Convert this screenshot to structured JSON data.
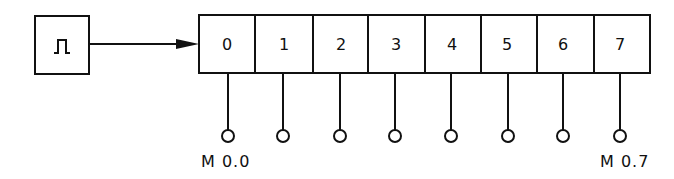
{
  "diagram": {
    "type": "shift-register-clock",
    "pulse_block": {
      "symbol": "pulse-icon"
    },
    "register": {
      "cells": [
        "0",
        "1",
        "2",
        "3",
        "4",
        "5",
        "6",
        "7"
      ]
    },
    "outputs": {
      "first_label": "M 0.0",
      "last_label": "M 0.7"
    },
    "colors": {
      "stroke": "#111111",
      "background": "#ffffff"
    }
  }
}
